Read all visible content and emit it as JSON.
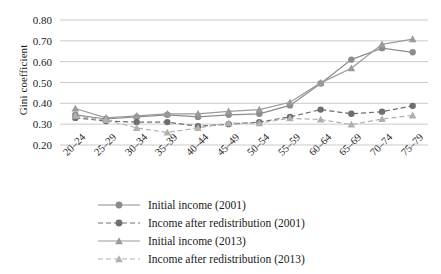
{
  "chart_data": {
    "type": "line",
    "title": "",
    "xlabel": "",
    "ylabel": "Gini coefficient",
    "categories": [
      "20–24",
      "25–29",
      "30–34",
      "35–39",
      "40–44",
      "45–49",
      "50–54",
      "55–59",
      "60–64",
      "65–69",
      "70–74",
      "75–79"
    ],
    "ylim": [
      0.2,
      0.8
    ],
    "ytick_labels": [
      "0.80",
      "0.70",
      "0.60",
      "0.50",
      "0.40",
      "0.30",
      "0.20"
    ],
    "ytick_values": [
      0.8,
      0.7,
      0.6,
      0.5,
      0.4,
      0.3,
      0.2
    ],
    "grid": true,
    "legend_position": "bottom",
    "series": [
      {
        "name": "Initial income (2001)",
        "marker": "circle",
        "line": "solid",
        "color": "#8c8c8c",
        "values": [
          0.345,
          0.325,
          0.335,
          0.345,
          0.335,
          0.345,
          0.35,
          0.39,
          0.495,
          0.61,
          0.665,
          0.645
        ]
      },
      {
        "name": "Income after redistribution (2001)",
        "marker": "circle",
        "line": "dashed",
        "color": "#6e6e6e",
        "values": [
          0.33,
          0.315,
          0.31,
          0.31,
          0.29,
          0.3,
          0.31,
          0.335,
          0.37,
          0.35,
          0.36,
          0.388
        ]
      },
      {
        "name": "Initial income (2013)",
        "marker": "triangle",
        "line": "solid",
        "color": "#9a9a9a",
        "values": [
          0.375,
          0.33,
          0.34,
          0.35,
          0.35,
          0.362,
          0.37,
          0.405,
          0.498,
          0.568,
          0.683,
          0.708
        ]
      },
      {
        "name": "Income after redistribution (2013)",
        "marker": "triangle",
        "line": "dashed",
        "color": "#b0b0b0",
        "values": [
          0.34,
          0.32,
          0.282,
          0.26,
          0.282,
          0.305,
          0.305,
          0.328,
          0.322,
          0.298,
          0.325,
          0.342
        ]
      }
    ]
  }
}
